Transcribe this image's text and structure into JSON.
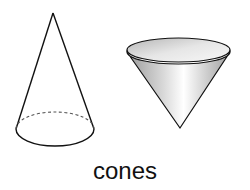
{
  "caption": "cones",
  "figures": [
    {
      "name": "wireframe-cone",
      "style": "line drawing with dashed hidden base edge",
      "orientation": "apex-up"
    },
    {
      "name": "shaded-cone",
      "style": "gray gradient shaded solid",
      "orientation": "apex-down"
    }
  ],
  "colors": {
    "stroke": "#111111",
    "shade_light": "#ffffff",
    "shade_dark": "#8a8a8a"
  }
}
